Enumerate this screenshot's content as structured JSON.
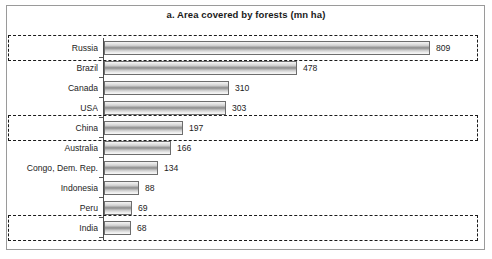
{
  "chart_data": {
    "type": "bar",
    "orientation": "horizontal",
    "title": "a. Area covered by forests (mn ha)",
    "xlabel": "",
    "ylabel": "",
    "unit": "mn ha",
    "grid": false,
    "legend": "none",
    "xlim": [
      0,
      809
    ],
    "categories": [
      "Russia",
      "Brazil",
      "Canada",
      "USA",
      "China",
      "Australia",
      "Congo, Dem. Rep.",
      "Indonesia",
      "Peru",
      "India"
    ],
    "values": [
      809,
      478,
      310,
      303,
      197,
      166,
      134,
      88,
      69,
      68
    ],
    "highlighted_categories": [
      "Russia",
      "China",
      "India"
    ],
    "points": [
      {
        "label": "Russia",
        "value": 809,
        "value_text": "809",
        "highlighted": true
      },
      {
        "label": "Brazil",
        "value": 478,
        "value_text": "478",
        "highlighted": false
      },
      {
        "label": "Canada",
        "value": 310,
        "value_text": "310",
        "highlighted": false
      },
      {
        "label": "USA",
        "value": 303,
        "value_text": "303",
        "highlighted": false
      },
      {
        "label": "China",
        "value": 197,
        "value_text": "197",
        "highlighted": true
      },
      {
        "label": "Australia",
        "value": 166,
        "value_text": "166",
        "highlighted": false
      },
      {
        "label": "Congo, Dem. Rep.",
        "value": 134,
        "value_text": "134",
        "highlighted": false
      },
      {
        "label": "Indonesia",
        "value": 88,
        "value_text": "88",
        "highlighted": false
      },
      {
        "label": "Peru",
        "value": 69,
        "value_text": "69",
        "highlighted": false
      },
      {
        "label": "India",
        "value": 68,
        "value_text": "68",
        "highlighted": true
      }
    ]
  },
  "colors": {
    "bar_outline": "#6d6d6d",
    "bar_fill_light": "#f4f4f4",
    "bar_fill_dark": "#8a8a8a",
    "axis": "#4a4a4a",
    "highlight_border": "#1a1a1a",
    "frame": "#9a9a9a",
    "text": "#1c1c1c",
    "background": "#ffffff"
  }
}
